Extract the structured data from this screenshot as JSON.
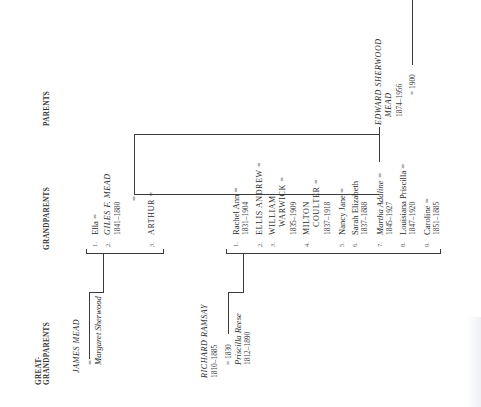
{
  "headers": {
    "great_grandparents": "GREAT-\nGRANDPARENTS",
    "great_grandparents_line1": "GREAT-",
    "great_grandparents_line2": "GRANDPARENTS",
    "grandparents": "GRANDPARENTS",
    "parents": "PARENTS"
  },
  "great_grandparents": {
    "mead": {
      "husband": "JAMES MEAD",
      "marriage_symbol": "=",
      "wife": "Margaret Sherwood"
    },
    "ramsay": {
      "husband": "RICHARD RAMSAY",
      "husband_dates": "1810–1885",
      "marriage": "= 1830",
      "wife": "Priscilla Reese",
      "wife_dates": "1812–1890"
    }
  },
  "mead_children": [
    {
      "num": "1.",
      "name": "Ella =",
      "dates": ""
    },
    {
      "num": "2.",
      "name": "GILES F. MEAD",
      "dates": "1841–1880"
    },
    {
      "num": "3.",
      "name": "ARTHUR =",
      "dates": ""
    }
  ],
  "mead_marriage_symbol": "=",
  "ramsay_children": [
    {
      "num": "1.",
      "name": "Rachel Ann =",
      "dates": "1831–1904"
    },
    {
      "num": "2.",
      "name": "ELLIS ANDREW =",
      "dates": ""
    },
    {
      "num": "3.",
      "name": "WILLIAM",
      "name2": "WARWICK =",
      "dates": "1835–1909"
    },
    {
      "num": "4.",
      "name": "MILTON",
      "name2": "COULTER =",
      "dates": "1837–1918"
    },
    {
      "num": "5.",
      "name": "Nancy Jane =",
      "dates": ""
    },
    {
      "num": "6.",
      "name": "Sarah Elizabeth",
      "dates": "1837–1888"
    },
    {
      "num": "7.",
      "name": "Martha Adaline =",
      "dates": "1845–1927"
    },
    {
      "num": "8.",
      "name": "Louisiana Priscilla =",
      "dates": "1847–1920"
    },
    {
      "num": "9.",
      "name": "Caroline =",
      "dates": "1851–1885"
    }
  ],
  "parents": {
    "name_line1": "EDWARD SHERWOOD",
    "name_line2": "MEAD",
    "dates": "1874–1956",
    "marriage": "= 1900"
  }
}
